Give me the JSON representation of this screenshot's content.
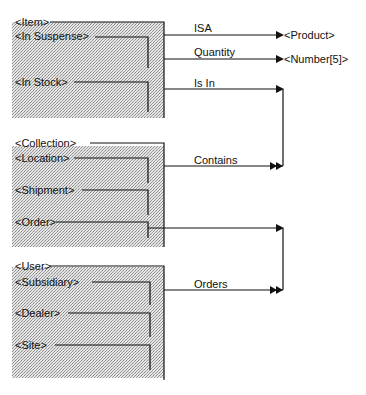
{
  "diagram": {
    "type": "data-model-schema",
    "entities": [
      {
        "name": "<Item>",
        "subtypes": [
          "<In Suspense>",
          "<In Stock>"
        ]
      },
      {
        "name": "<Collection>",
        "subtypes": [
          "<Location>",
          "<Shipment>",
          "<Order>"
        ]
      },
      {
        "name": "<User>",
        "subtypes": [
          "<Subsidiary>",
          "<Dealer>",
          "<Site>"
        ]
      }
    ],
    "relationships": [
      {
        "label": "ISA",
        "from": "<Item>",
        "to": "<Product>",
        "arrow": "single"
      },
      {
        "label": "Quantity",
        "from": "<Item>",
        "to": "<Number[5]>",
        "arrow": "single"
      },
      {
        "label": "Is In",
        "from": "<Item>",
        "to": "<Collection>",
        "arrow": "single",
        "inverse": "Contains",
        "inverse_arrow": "double"
      },
      {
        "label": "Orders",
        "from": "<User>",
        "to": "<Order>",
        "arrow": "double",
        "inverse_arrow": "single"
      }
    ],
    "targets": [
      "<Product>",
      "<Number[5]>"
    ]
  },
  "colors": {
    "box_fill": "#cfcfcf",
    "line": "#111111",
    "background": "#ffffff"
  }
}
